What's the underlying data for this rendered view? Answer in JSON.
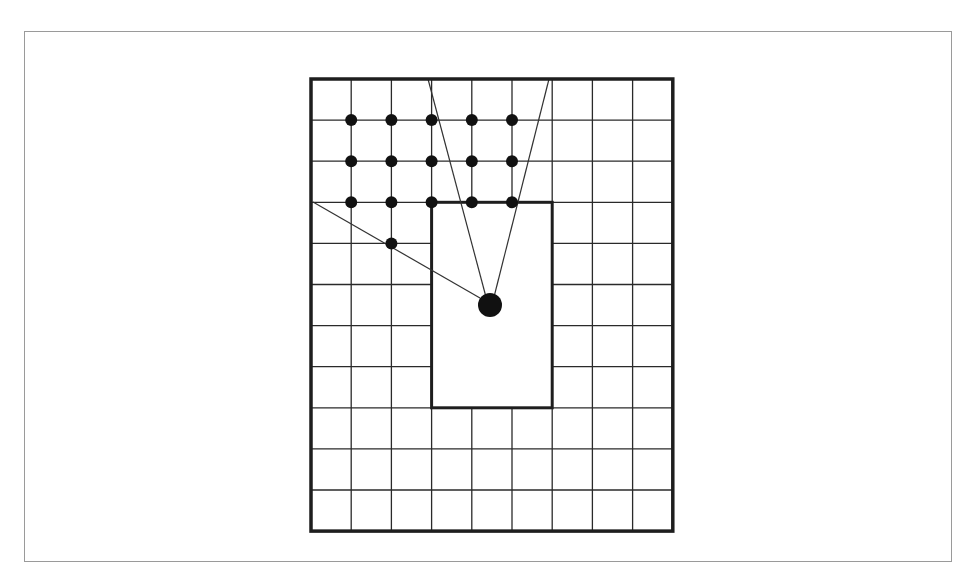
{
  "figure": {
    "frame": {
      "x": 24,
      "y": 31,
      "w": 928,
      "h": 531,
      "stroke": "#9a9a9a"
    },
    "grid": {
      "x": 311,
      "y": 79,
      "cols": 9,
      "rows": 11,
      "cell_w": 40.2,
      "cell_h": 41.1,
      "line_color": "#2a2a2a",
      "line_width": 1.3,
      "border_color": "#1e1e1e",
      "border_width": 3.5
    },
    "obstacle": {
      "label": "inner-rectangle",
      "col": 3,
      "row": 3,
      "cols": 3,
      "rows": 5,
      "fill": "#ffffff",
      "stroke": "#1e1e1e",
      "stroke_width": 3
    },
    "small_dots": {
      "radius": 6,
      "color": "#111111",
      "points": [
        [
          1,
          1
        ],
        [
          2,
          1
        ],
        [
          3,
          1
        ],
        [
          4,
          1
        ],
        [
          5,
          1
        ],
        [
          1,
          2
        ],
        [
          2,
          2
        ],
        [
          3,
          2
        ],
        [
          4,
          2
        ],
        [
          5,
          2
        ],
        [
          1,
          3
        ],
        [
          2,
          3
        ],
        [
          3,
          3
        ],
        [
          4,
          3
        ],
        [
          5,
          3
        ],
        [
          2,
          4
        ]
      ]
    },
    "source": {
      "x": 490,
      "y": 305,
      "radius": 12,
      "color": "#111111"
    },
    "rays": {
      "color": "#333333",
      "width": 1.2,
      "segments": [
        {
          "x1": 428,
          "y1": 79,
          "x2": 486,
          "y2": 297
        },
        {
          "x1": 549,
          "y1": 79,
          "x2": 494,
          "y2": 297
        },
        {
          "x1": 313,
          "y1": 202,
          "x2": 480,
          "y2": 298
        }
      ]
    }
  }
}
